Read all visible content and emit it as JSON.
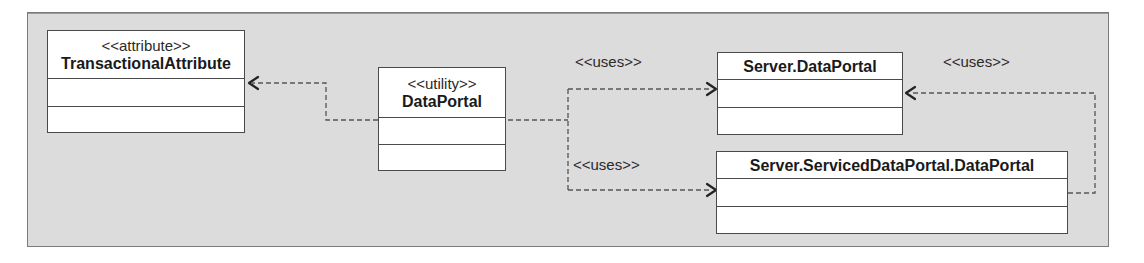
{
  "diagram": {
    "type": "UML class diagram",
    "background_color": "#dcdcdc",
    "classes": [
      {
        "id": "transactional-attribute",
        "stereotype": "<<attribute>>",
        "name": "TransactionalAttribute",
        "attributes": [],
        "operations": []
      },
      {
        "id": "data-portal",
        "stereotype": "<<utility>>",
        "name": "DataPortal",
        "attributes": [],
        "operations": []
      },
      {
        "id": "server-data-portal",
        "stereotype": "",
        "name": "Server.DataPortal",
        "attributes": [],
        "operations": []
      },
      {
        "id": "serviced-data-portal",
        "stereotype": "",
        "name": "Server.ServicedDataPortal.DataPortal",
        "attributes": [],
        "operations": []
      }
    ],
    "relationships": [
      {
        "from": "DataPortal",
        "to": "TransactionalAttribute",
        "kind": "dependency",
        "label": ""
      },
      {
        "from": "DataPortal",
        "to": "Server.DataPortal",
        "kind": "dependency",
        "label": "<<uses>>"
      },
      {
        "from": "DataPortal",
        "to": "Server.ServicedDataPortal.DataPortal",
        "kind": "dependency",
        "label": "<<uses>>"
      },
      {
        "from": "Server.ServicedDataPortal.DataPortal",
        "to": "Server.DataPortal",
        "kind": "dependency",
        "label": "<<uses>>"
      }
    ]
  },
  "labels": {
    "uses_top": "<<uses>>",
    "uses_bottom": "<<uses>>",
    "uses_right": "<<uses>>"
  }
}
